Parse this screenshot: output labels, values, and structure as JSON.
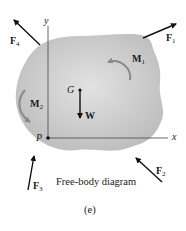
{
  "diagram": {
    "caption": "Free-body diagram",
    "figure_label": "(e)",
    "axes": {
      "x_label": "x",
      "y_label": "y"
    },
    "points": {
      "origin": "P",
      "center_of_gravity": "G"
    },
    "forces": [
      {
        "name": "F",
        "sub": "1"
      },
      {
        "name": "F",
        "sub": "2"
      },
      {
        "name": "F",
        "sub": "3"
      },
      {
        "name": "F",
        "sub": "4"
      }
    ],
    "weight": {
      "name": "W"
    },
    "moments": [
      {
        "name": "M",
        "sub": "1"
      },
      {
        "name": "M",
        "sub": "2"
      }
    ],
    "colors": {
      "body_fill": "#cfcfcf",
      "moment_arrow": "#8a8a8a",
      "vector": "#111111"
    }
  }
}
